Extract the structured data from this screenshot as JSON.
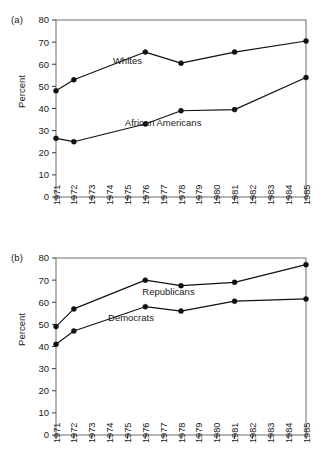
{
  "figure": {
    "panel_a_label": "(a)",
    "panel_b_label": "(b)"
  },
  "chart_data": [
    {
      "type": "line",
      "panel": "(a)",
      "title": "",
      "xlabel": "",
      "ylabel": "Percent",
      "ylim": [
        0,
        80
      ],
      "yticks": [
        0,
        10,
        20,
        30,
        40,
        50,
        60,
        70,
        80
      ],
      "ytick_labels": [
        "0",
        "10",
        "20",
        "30",
        "40",
        "50",
        "60",
        "70",
        "80"
      ],
      "xlim": [
        1971,
        1985
      ],
      "xticks": [
        1971,
        1972,
        1973,
        1974,
        1975,
        1976,
        1977,
        1978,
        1979,
        1980,
        1981,
        1982,
        1983,
        1984,
        1985
      ],
      "xtick_labels": [
        "1971",
        "1972",
        "1973",
        "1974",
        "1975",
        "1976",
        "1977",
        "1978",
        "1979",
        "1980",
        "1981",
        "1982",
        "1983",
        "1984",
        "1985"
      ],
      "grid": false,
      "legend_position": "inline-annotation",
      "x": [
        1971,
        1972,
        1976,
        1978,
        1981,
        1985
      ],
      "series": [
        {
          "name": "Whites",
          "values": [
            48,
            53,
            65.5,
            60.5,
            65.5,
            70.5
          ],
          "label_x": 1975.0,
          "label_y": 60.0
        },
        {
          "name": "African Americans",
          "values": [
            26.5,
            25,
            33,
            39,
            39.5,
            54
          ],
          "label_x": 1977.0,
          "label_y": 32.0
        }
      ]
    },
    {
      "type": "line",
      "panel": "(b)",
      "title": "",
      "xlabel": "",
      "ylabel": "Percent",
      "ylim": [
        0,
        80
      ],
      "yticks": [
        0,
        10,
        20,
        30,
        40,
        50,
        60,
        70,
        80
      ],
      "ytick_labels": [
        "0",
        "10",
        "20",
        "30",
        "40",
        "50",
        "60",
        "70",
        "80"
      ],
      "xlim": [
        1971,
        1985
      ],
      "xticks": [
        1971,
        1972,
        1973,
        1974,
        1975,
        1976,
        1977,
        1978,
        1979,
        1980,
        1981,
        1982,
        1983,
        1984,
        1985
      ],
      "xtick_labels": [
        "1971",
        "1972",
        "1973",
        "1974",
        "1975",
        "1976",
        "1977",
        "1978",
        "1979",
        "1980",
        "1981",
        "1982",
        "1983",
        "1984",
        "1985"
      ],
      "grid": false,
      "legend_position": "inline-annotation",
      "x": [
        1971,
        1972,
        1976,
        1978,
        1981,
        1985
      ],
      "series": [
        {
          "name": "Republicans",
          "values": [
            49,
            57,
            70,
            67.5,
            69,
            77
          ],
          "label_x": 1977.3,
          "label_y": 63.5
        },
        {
          "name": "Democrats",
          "values": [
            41,
            47,
            58,
            56,
            60.5,
            61.5
          ],
          "label_x": 1975.2,
          "label_y": 51.5
        }
      ]
    }
  ],
  "colors": {
    "line": "#111111",
    "marker": "#111111",
    "frame": "#6e6e6e",
    "text": "#1a1a1a",
    "background": "#ffffff"
  }
}
